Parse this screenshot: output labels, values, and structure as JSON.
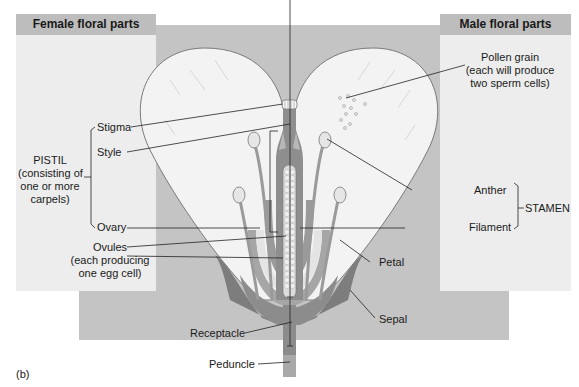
{
  "figure_label": "(b)",
  "panels": {
    "female": {
      "title": "Female floral parts"
    },
    "male": {
      "title": "Male floral parts"
    }
  },
  "labels": {
    "stigma": "Stigma",
    "style": "Style",
    "pistil_line1": "PISTIL",
    "pistil_line2": "(consisting of",
    "pistil_line3": "one or more",
    "pistil_line4": "carpels)",
    "ovary": "Ovary",
    "ovules_line1": "Ovules",
    "ovules_line2": "(each producing",
    "ovules_line3": "one egg cell)",
    "pollen_line1": "Pollen grain",
    "pollen_line2": "(each will produce",
    "pollen_line3": "two sperm cells)",
    "anther": "Anther",
    "filament": "Filament",
    "stamen": "STAMEN",
    "petal": "Petal",
    "sepal": "Sepal",
    "receptacle": "Receptacle",
    "peduncle": "Peduncle"
  },
  "colors": {
    "background_panel": "#c4c4c4",
    "side_panel": "#ededed",
    "side_header": "#bdbdbd",
    "petal_fill": "#f2f2f2",
    "tissue_dark": "#8c8c8c",
    "tissue_mid": "#a8a8a8",
    "ovule_fill": "#e6e6e6"
  }
}
